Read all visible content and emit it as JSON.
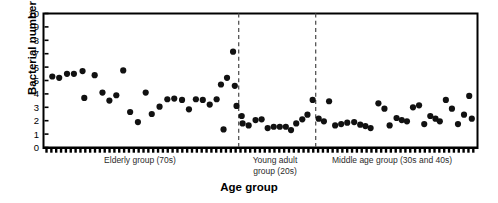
{
  "chart_data": {
    "type": "scatter",
    "title": "",
    "xlabel": "Age group",
    "ylabel": "Bacterial number (log)",
    "ylim": [
      0,
      10
    ],
    "yticks": [
      0,
      1,
      2,
      3,
      4,
      5,
      6,
      7,
      8,
      9,
      10
    ],
    "grid": false,
    "legend": "none",
    "marker": "filled-circle",
    "marker_color": "#111111",
    "frame_color": "#000000",
    "divider_style": "dashed",
    "divider_color": "#555555",
    "xlim": [
      0,
      100
    ],
    "group_labels": [
      "Elderly group (70s)",
      "Young adult\ngroup (20s)",
      "Middle age group (30s and 40s)"
    ],
    "group_boundaries_pct": [
      44.9,
      62.7
    ],
    "series": [
      {
        "name": "Elderly group (70s)",
        "x_range_pct": [
          0,
          44.9
        ],
        "points": [
          {
            "x": 1.8,
            "y": 5.3
          },
          {
            "x": 3.4,
            "y": 5.2
          },
          {
            "x": 5.2,
            "y": 5.5
          },
          {
            "x": 6.8,
            "y": 5.5
          },
          {
            "x": 8.8,
            "y": 5.7
          },
          {
            "x": 9.2,
            "y": 3.7
          },
          {
            "x": 11.6,
            "y": 5.4
          },
          {
            "x": 13.4,
            "y": 4.1
          },
          {
            "x": 15.0,
            "y": 3.5
          },
          {
            "x": 16.6,
            "y": 3.9
          },
          {
            "x": 18.2,
            "y": 5.75
          },
          {
            "x": 19.8,
            "y": 2.65
          },
          {
            "x": 21.6,
            "y": 1.9
          },
          {
            "x": 23.4,
            "y": 4.1
          },
          {
            "x": 24.8,
            "y": 2.5
          },
          {
            "x": 26.6,
            "y": 3.05
          },
          {
            "x": 28.4,
            "y": 3.6
          },
          {
            "x": 30.0,
            "y": 3.65
          },
          {
            "x": 31.8,
            "y": 3.55
          },
          {
            "x": 33.4,
            "y": 2.85
          },
          {
            "x": 35.0,
            "y": 3.6
          },
          {
            "x": 36.6,
            "y": 3.55
          },
          {
            "x": 38.2,
            "y": 3.2
          },
          {
            "x": 39.8,
            "y": 3.6
          },
          {
            "x": 40.8,
            "y": 4.7
          },
          {
            "x": 42.2,
            "y": 5.2
          },
          {
            "x": 41.4,
            "y": 1.35
          },
          {
            "x": 43.6,
            "y": 7.15
          },
          {
            "x": 44.0,
            "y": 4.6
          },
          {
            "x": 44.4,
            "y": 3.1
          }
        ]
      },
      {
        "name": "Young adult group (20s)",
        "x_range_pct": [
          44.9,
          62.7
        ],
        "points": [
          {
            "x": 45.6,
            "y": 2.35
          },
          {
            "x": 45.8,
            "y": 1.8
          },
          {
            "x": 47.2,
            "y": 1.65
          },
          {
            "x": 48.8,
            "y": 2.05
          },
          {
            "x": 50.2,
            "y": 2.1
          },
          {
            "x": 51.6,
            "y": 1.45
          },
          {
            "x": 53.0,
            "y": 1.55
          },
          {
            "x": 54.4,
            "y": 1.55
          },
          {
            "x": 55.8,
            "y": 1.55
          },
          {
            "x": 57.0,
            "y": 1.3
          },
          {
            "x": 58.2,
            "y": 1.8
          },
          {
            "x": 59.6,
            "y": 2.1
          },
          {
            "x": 60.8,
            "y": 2.45
          },
          {
            "x": 62.0,
            "y": 3.55
          }
        ]
      },
      {
        "name": "Middle age group (30s and 40s)",
        "x_range_pct": [
          62.7,
          100
        ],
        "points": [
          {
            "x": 63.4,
            "y": 2.15
          },
          {
            "x": 64.6,
            "y": 1.95
          },
          {
            "x": 65.8,
            "y": 3.45
          },
          {
            "x": 67.2,
            "y": 1.65
          },
          {
            "x": 68.6,
            "y": 1.75
          },
          {
            "x": 70.0,
            "y": 1.85
          },
          {
            "x": 71.6,
            "y": 1.9
          },
          {
            "x": 73.0,
            "y": 1.7
          },
          {
            "x": 74.2,
            "y": 1.6
          },
          {
            "x": 75.4,
            "y": 1.45
          },
          {
            "x": 77.2,
            "y": 3.3
          },
          {
            "x": 78.6,
            "y": 2.9
          },
          {
            "x": 79.8,
            "y": 1.65
          },
          {
            "x": 81.4,
            "y": 2.2
          },
          {
            "x": 82.6,
            "y": 2.05
          },
          {
            "x": 83.8,
            "y": 1.95
          },
          {
            "x": 85.2,
            "y": 3.0
          },
          {
            "x": 86.6,
            "y": 3.15
          },
          {
            "x": 87.8,
            "y": 1.75
          },
          {
            "x": 89.2,
            "y": 2.35
          },
          {
            "x": 90.4,
            "y": 2.15
          },
          {
            "x": 91.4,
            "y": 1.95
          },
          {
            "x": 92.8,
            "y": 3.55
          },
          {
            "x": 94.2,
            "y": 2.9
          },
          {
            "x": 95.6,
            "y": 1.75
          },
          {
            "x": 97.0,
            "y": 2.45
          },
          {
            "x": 98.2,
            "y": 3.85
          },
          {
            "x": 98.8,
            "y": 2.15
          }
        ]
      }
    ]
  },
  "axes": {
    "y_title": "Bacterial number (log)",
    "x_title": "Age group"
  },
  "group_captions": {
    "elderly": "Elderly group (70s)",
    "young_line1": "Young adult",
    "young_line2": "group (20s)",
    "middle": "Middle age group (30s and 40s)"
  }
}
